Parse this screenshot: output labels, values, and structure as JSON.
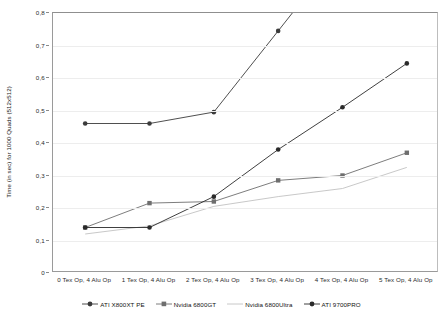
{
  "chart_data": {
    "type": "line",
    "title": "",
    "xlabel": "",
    "ylabel": "Time (in sec) for 1000 Quads (512x512)",
    "categories": [
      "0 Tex Op, 4 Alu Op",
      "1 Tex Op, 4 Alu Op",
      "2 Tex Op, 4 Alu Op",
      "3 Tex Op, 4 Alu Op",
      "4 Tex Op, 4 Alu Op",
      "5 Tex Op, 4 Alu Op"
    ],
    "ylim": [
      0,
      0.8
    ],
    "yticks": [
      "0",
      "0,1",
      "0,2",
      "0,3",
      "0,4",
      "0,5",
      "0,6",
      "0,7",
      "0,8"
    ],
    "ytick_values": [
      0,
      0.1,
      0.2,
      0.3,
      0.4,
      0.5,
      0.6,
      0.7,
      0.8
    ],
    "grid": true,
    "legend_position": "bottom",
    "series": [
      {
        "name": "ATI X800XT PE",
        "color": "#3b3b3b",
        "marker": "diamond",
        "values": [
          0.46,
          0.46,
          0.495,
          0.745,
          null,
          null
        ],
        "clipped_after_index": 3
      },
      {
        "name": "Nvidia 6800GT",
        "color": "#6e6e6e",
        "marker": "square",
        "values": [
          0.14,
          0.215,
          0.22,
          0.285,
          0.3,
          0.37
        ]
      },
      {
        "name": "Nvidia 6800Ultra",
        "color": "#c2c2c2",
        "marker": "none",
        "values": [
          0.12,
          0.145,
          0.205,
          0.235,
          0.26,
          0.325
        ]
      },
      {
        "name": "ATI 9700PRO",
        "color": "#2a2a2a",
        "marker": "diamond",
        "values": [
          0.14,
          0.14,
          0.235,
          0.38,
          0.51,
          0.645
        ]
      }
    ]
  },
  "legend": {
    "items": [
      {
        "label": "ATI X800XT PE",
        "marker": "diamond-marker-icon",
        "color": "#3b3b3b"
      },
      {
        "label": "Nvidia 6800GT",
        "marker": "square-marker-icon",
        "color": "#6e6e6e"
      },
      {
        "label": "Nvidia 6800Ultra",
        "marker": "line-marker-icon",
        "color": "#c2c2c2"
      },
      {
        "label": "ATI 9700PRO",
        "marker": "diamond-marker-icon",
        "color": "#2a2a2a"
      }
    ]
  }
}
